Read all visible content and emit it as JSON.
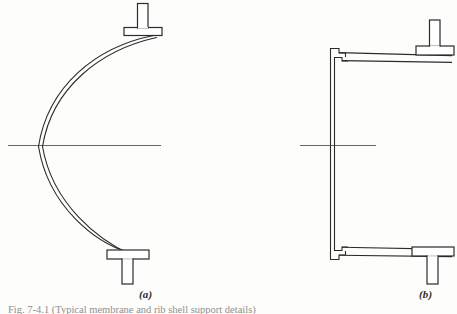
{
  "figure": {
    "caption": "Fig. 7-4.1  (Typical membrane and rib shell support details)",
    "background_color": "#fdfdfc",
    "line_color": "#2b2b2b",
    "centerline_color": "#55565a",
    "panels": [
      {
        "id": "panel-a",
        "label": "(a)",
        "label_x": 148,
        "label_y": 295,
        "description": "Curved thin shell arc supported between two T-section supports",
        "shell": {
          "type": "arc",
          "shape": "bulges-left",
          "thickness_px": 2.2,
          "top_end": {
            "x": 155,
            "y": 36
          },
          "apex": {
            "x": 37,
            "y": 147
          },
          "bottom_end": {
            "x": 130,
            "y": 254
          }
        },
        "centerline": {
          "x1": 8,
          "y1": 145,
          "x2": 161,
          "y2": 145
        },
        "supports": [
          {
            "name": "top-tee-support",
            "orientation": "upright",
            "flange": {
              "x": 124,
              "y": 28,
              "w": 38,
              "h": 8
            },
            "web": {
              "x": 138,
              "y": 4,
              "w": 10,
              "h": 24
            }
          },
          {
            "name": "bottom-tee-support",
            "orientation": "inverted",
            "flange": {
              "x": 107,
              "y": 250,
              "w": 42,
              "h": 9
            },
            "web": {
              "x": 122,
              "y": 259,
              "w": 11,
              "h": 25
            }
          }
        ]
      },
      {
        "id": "panel-b",
        "label": "(b)",
        "label_x": 428,
        "label_y": 295,
        "description": "Angular folded plate profile with stepped corner joints and T-section supports",
        "wall": {
          "type": "vertical-double-line",
          "x": 330,
          "y_top": 56,
          "y_bottom": 252,
          "thickness_px": 4
        },
        "members": [
          {
            "name": "top-horizontal-member",
            "x1": 340,
            "y1": 55,
            "x2": 450,
            "y2": 58,
            "thickness_px": 4
          },
          {
            "name": "bottom-horizontal-member",
            "x1": 340,
            "y1": 250,
            "x2": 450,
            "y2": 253,
            "thickness_px": 4
          }
        ],
        "corners": [
          {
            "name": "top-stepped-corner",
            "x": 330,
            "y": 48
          },
          {
            "name": "bottom-stepped-corner",
            "x": 330,
            "y": 246
          }
        ],
        "centerline": {
          "x1": 300,
          "y1": 145,
          "x2": 376,
          "y2": 145
        },
        "supports": [
          {
            "name": "top-tee-support",
            "orientation": "upright",
            "flange": {
              "x": 416,
              "y": 46,
              "w": 38,
              "h": 9
            },
            "web": {
              "x": 430,
              "y": 20,
              "w": 10,
              "h": 26
            }
          },
          {
            "name": "bottom-tee-support",
            "orientation": "inverted",
            "flange": {
              "x": 412,
              "y": 247,
              "w": 42,
              "h": 9
            },
            "web": {
              "x": 427,
              "y": 256,
              "w": 11,
              "h": 28
            }
          }
        ]
      }
    ]
  }
}
